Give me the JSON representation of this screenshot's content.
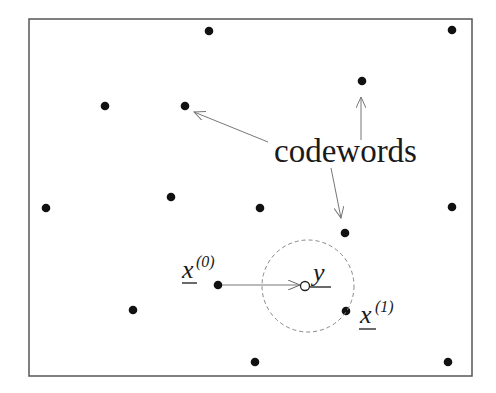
{
  "diagram": {
    "label_codewords": "codewords",
    "received": {
      "symbol": "y",
      "x": 305,
      "y": 285
    },
    "transmitted": {
      "symbol": "x",
      "superscript": "(0)",
      "x": 218,
      "y": 285
    },
    "nearest": {
      "symbol": "x",
      "superscript": "(1)",
      "x": 346,
      "y": 311
    },
    "decision_radius": 46,
    "codewords": [
      {
        "x": 209,
        "y": 31
      },
      {
        "x": 452,
        "y": 30
      },
      {
        "x": 362,
        "y": 81
      },
      {
        "x": 105,
        "y": 106
      },
      {
        "x": 185,
        "y": 106
      },
      {
        "x": 46,
        "y": 208
      },
      {
        "x": 171,
        "y": 197
      },
      {
        "x": 260,
        "y": 208
      },
      {
        "x": 452,
        "y": 207
      },
      {
        "x": 345,
        "y": 233
      },
      {
        "x": 218,
        "y": 285
      },
      {
        "x": 133,
        "y": 310
      },
      {
        "x": 346,
        "y": 311
      },
      {
        "x": 255,
        "y": 362
      },
      {
        "x": 448,
        "y": 362
      }
    ],
    "colors": {
      "dot": "#111111",
      "arrow": "#777777",
      "frame": "#555555",
      "text": "#1a1a1a"
    }
  }
}
